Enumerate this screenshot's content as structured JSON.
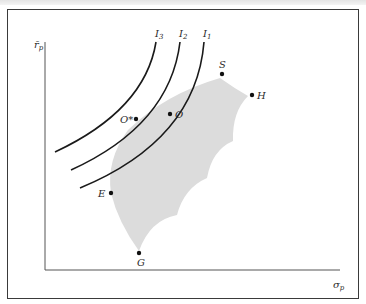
{
  "figure": {
    "type": "efficient-set-indifference-curves",
    "axes": {
      "y_label": "r̄",
      "y_label_sub": "p",
      "x_label": "σ",
      "x_label_sub": "p"
    },
    "indifference_curves": [
      {
        "label": "I",
        "sub": "3"
      },
      {
        "label": "I",
        "sub": "2"
      },
      {
        "label": "I",
        "sub": "1"
      }
    ],
    "points": {
      "S": "S",
      "H": "H",
      "O_star": "O*",
      "O": "O",
      "E": "E",
      "G": "G"
    },
    "colors": {
      "feasible_set": "#dcdcdc",
      "curves": "#1a1a1a",
      "axes": "#555555",
      "frame": "#3a3a3a"
    }
  }
}
